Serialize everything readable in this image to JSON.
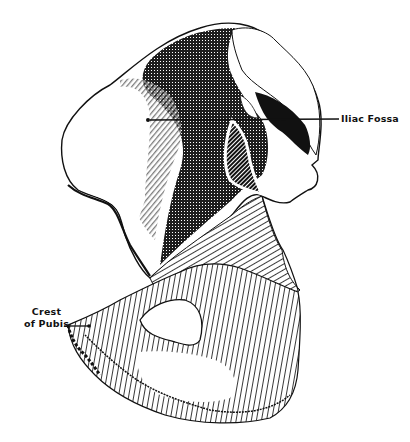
{
  "figure": {
    "style": "pen-and-ink hatching illustration"
  },
  "labels": {
    "iliac_fossa": "Iliac Fossa",
    "crest_of_pubis_line1": "Crest",
    "crest_of_pubis_line2": "of Pubis"
  },
  "colors": {
    "ink": "#111111",
    "paper": "#ffffff"
  }
}
